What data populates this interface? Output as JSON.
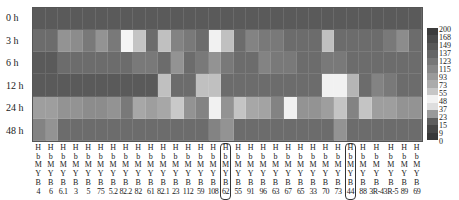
{
  "chart_data": {
    "type": "heatmap",
    "title": "",
    "xlabel": "",
    "ylabel": "",
    "rows": [
      "0 h",
      "3 h",
      "6 h",
      "12 h",
      "24 h",
      "48 h"
    ],
    "columns": [
      "HbMYB4",
      "HbMYB6",
      "HbMYB6.1",
      "HbMYB3",
      "HbMYB5",
      "HbMYB75",
      "HbMYB5.2",
      "HbMYB82.2",
      "HbMYB82",
      "HbMYB61",
      "HbMYB82.1",
      "HbMYB23",
      "HbMYB112",
      "HbMYB59",
      "HbMYB108",
      "HbMYB62",
      "HbMYB55",
      "HbMYB91",
      "HbMYB96",
      "HbMYB63",
      "HbMYB67",
      "HbMYB65",
      "HbMYB33",
      "HbMYB70",
      "HbMYB73",
      "HbMYB44",
      "HbMYB88",
      "HbMYB3R-4",
      "HbMYB3R-5",
      "HbMYB89",
      "HbMYB69"
    ],
    "column_prefix": [
      "H",
      "b",
      "M",
      "Y",
      "B"
    ],
    "column_suffix": [
      "4",
      "6",
      "6.1",
      "3",
      "5",
      "75",
      "5.2",
      "82.2",
      "82",
      "61",
      "82.1",
      "23",
      "112",
      "59",
      "108",
      "62",
      "55",
      "91",
      "96",
      "63",
      "67",
      "65",
      "33",
      "70",
      "73",
      "44",
      "88",
      "3R-4",
      "3R-5",
      "89",
      "69"
    ],
    "highlighted_columns": [
      "62",
      "44"
    ],
    "values": [
      [
        1,
        1,
        1,
        1,
        1,
        1,
        1,
        1,
        1,
        1,
        1,
        1,
        1,
        1,
        1,
        1,
        1,
        1,
        1,
        1,
        1,
        1,
        1,
        1,
        1,
        1,
        1,
        1,
        1,
        1,
        1
      ],
      [
        2,
        2,
        6,
        5,
        3,
        6,
        3,
        60,
        20,
        2,
        18,
        4,
        3,
        2,
        55,
        18,
        2,
        4,
        3,
        3,
        2,
        2,
        2,
        18,
        2,
        2,
        2,
        2,
        3,
        5,
        2
      ],
      [
        1,
        1,
        2,
        2,
        2,
        2,
        2,
        2,
        3,
        3,
        2,
        6,
        2,
        3,
        6,
        3,
        2,
        2,
        4,
        3,
        3,
        2,
        2,
        3,
        3,
        2,
        2,
        2,
        2,
        2,
        2
      ],
      [
        1,
        1,
        1,
        1,
        1,
        1,
        1,
        1,
        1,
        1,
        18,
        2,
        2,
        18,
        18,
        2,
        2,
        2,
        2,
        2,
        2,
        2,
        2,
        55,
        55,
        14,
        2,
        4,
        3,
        2,
        2
      ],
      [
        8,
        8,
        6,
        6,
        5,
        5,
        6,
        3,
        10,
        8,
        10,
        22,
        6,
        4,
        55,
        6,
        20,
        10,
        9,
        4,
        55,
        6,
        6,
        8,
        20,
        4,
        20,
        8,
        8,
        6,
        6
      ],
      [
        4,
        6,
        2,
        2,
        2,
        2,
        2,
        2,
        2,
        2,
        2,
        2,
        2,
        2,
        4,
        6,
        2,
        2,
        2,
        2,
        2,
        2,
        2,
        2,
        6,
        2,
        2,
        2,
        2,
        2,
        2
      ]
    ],
    "legend": {
      "ticks": [
        "200",
        "168",
        "149",
        "137",
        "123",
        "115",
        "93",
        "73",
        "55",
        "48",
        "37",
        "23",
        "15",
        "9",
        "0"
      ],
      "range": [
        0,
        200
      ]
    },
    "grid": true,
    "legend_position": "right"
  },
  "colors": {
    "legend_swatches": [
      "#3c3c3c",
      "#4a4a4a",
      "#585858",
      "#666666",
      "#777777",
      "#888888",
      "#9a9a9a",
      "#ababab",
      "#c6c6c6",
      "#f2f2f2",
      "#dedede",
      "#9a9a9a",
      "#5e5e5e",
      "#464646",
      "#383838"
    ]
  }
}
